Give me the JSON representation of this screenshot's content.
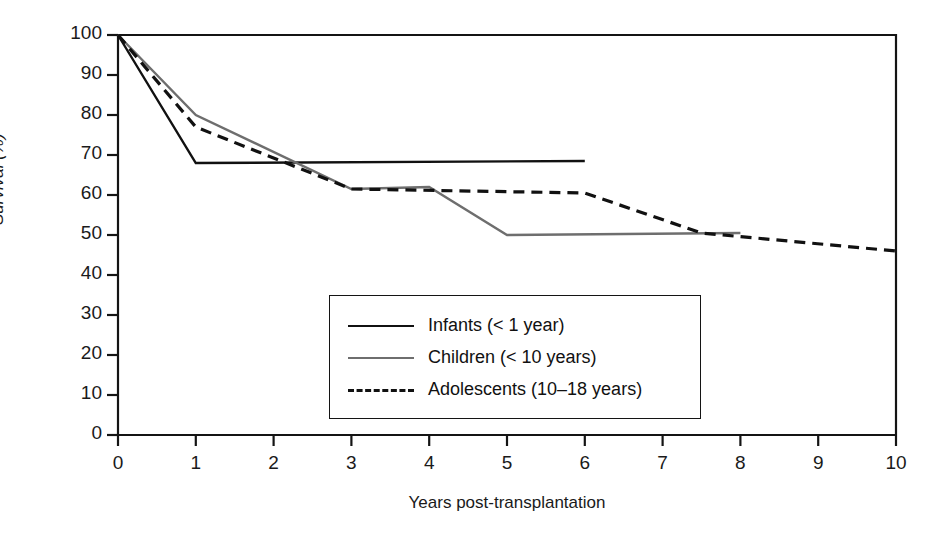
{
  "chart_data": {
    "type": "line",
    "title": "",
    "subtitle": "",
    "xlabel": "Years post-transplantation",
    "ylabel": "Survival (%)",
    "xlim": [
      0,
      10
    ],
    "ylim": [
      0,
      100
    ],
    "xticks": [
      "0",
      "1",
      "2",
      "3",
      "4",
      "5",
      "6",
      "7",
      "8",
      "9",
      "10"
    ],
    "yticks": [
      "0",
      "10",
      "20",
      "30",
      "40",
      "50",
      "60",
      "70",
      "80",
      "90",
      "100"
    ],
    "grid": false,
    "legend_position": "center",
    "annotations": [],
    "series": [
      {
        "name": "Infants (< 1 year)",
        "style": "solid",
        "color": "#111111",
        "x": [
          0,
          1,
          6
        ],
        "values": [
          100,
          68,
          68.5
        ]
      },
      {
        "name": "Children (< 10 years)",
        "style": "solid",
        "color": "#6e6e6e",
        "x": [
          0,
          1,
          3,
          4,
          5,
          8
        ],
        "values": [
          100,
          80,
          61.5,
          62,
          50,
          50.5
        ]
      },
      {
        "name": "Adolescents (10–18 years)",
        "style": "dashed",
        "color": "#111111",
        "x": [
          0,
          1,
          3,
          6,
          7.5,
          10
        ],
        "values": [
          100,
          77,
          61.5,
          60.5,
          50.5,
          46
        ]
      }
    ]
  },
  "legend": {
    "items": [
      {
        "label": "Infants (< 1 year)",
        "swatch": "solid-black"
      },
      {
        "label": "Children (< 10 years)",
        "swatch": "solid-gray"
      },
      {
        "label": "Adolescents (10–18 years)",
        "swatch": "dashed"
      }
    ]
  },
  "colors": {
    "axis": "#141414",
    "infants": "#111111",
    "children": "#6e6e6e",
    "adolescents": "#111111",
    "background": "#ffffff"
  }
}
